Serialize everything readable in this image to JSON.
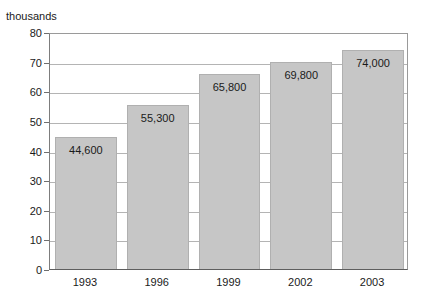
{
  "chart_data": {
    "type": "bar",
    "title": "",
    "subtitle": "",
    "xlabel": "",
    "ylabel": "thousands",
    "categories": [
      "1993",
      "1996",
      "1999",
      "2002",
      "2003"
    ],
    "values": [
      44600,
      55300,
      65800,
      69800,
      74000
    ],
    "value_labels": [
      "44,600",
      "55,300",
      "65,800",
      "69,800",
      "74,000"
    ],
    "ylim": [
      0,
      80
    ],
    "y_unit_scale": 1000,
    "y_ticks": [
      0,
      10,
      20,
      30,
      40,
      50,
      60,
      70,
      80
    ],
    "y_tick_labels": [
      "0",
      "10",
      "20",
      "30",
      "40",
      "50",
      "60",
      "70",
      "80"
    ],
    "grid": true,
    "grid_axis": "y",
    "legend": false,
    "legend_position": "none",
    "series": [
      {
        "name": "",
        "values": [
          44600,
          55300,
          65800,
          69800,
          74000
        ]
      }
    ],
    "colors": {
      "bar_fill": "#c6c6c6",
      "bar_border": "#b0b0b0",
      "gridline": "#b4b4b4",
      "axis": "#6e6e6e",
      "text": "#1a1a1a",
      "background": "#ffffff"
    }
  }
}
